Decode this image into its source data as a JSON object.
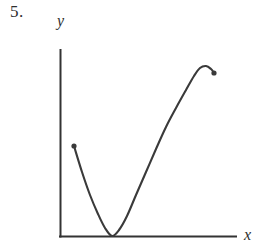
{
  "figure": {
    "problem_number": "5.",
    "y_axis_label": "y",
    "x_axis_label": "x",
    "stroke_color": "#3a3a3a",
    "axis_color": "#333333",
    "background_color": "#ffffff"
  },
  "chart_data": {
    "type": "line",
    "title": "",
    "subtitle": "",
    "xlabel": "x",
    "ylabel": "y",
    "grid": false,
    "legend": null,
    "annotations": [
      "5."
    ],
    "axes": {
      "y_axis_pixel_x": 60,
      "y_axis_pixel_top": 50,
      "x_axis_pixel_y": 236,
      "x_axis_pixel_right": 236,
      "origin_px": [
        60,
        236
      ],
      "tick_labels_x": [],
      "tick_labels_y": []
    },
    "endpoints": [
      {
        "name": "left-endpoint",
        "px": [
          74,
          146
        ],
        "closed": true
      },
      {
        "name": "right-endpoint",
        "px": [
          214,
          73
        ],
        "closed": true
      }
    ],
    "critical_points": [
      {
        "name": "local-minimum",
        "px": [
          112,
          236
        ],
        "type": "minimum",
        "touches_x_axis": true
      },
      {
        "name": "local-maximum",
        "px": [
          203,
          66
        ],
        "type": "maximum"
      }
    ],
    "inflection_points": [
      {
        "name": "inflection",
        "px": [
          152,
          158
        ]
      }
    ],
    "curve_points_px": [
      [
        74,
        146
      ],
      [
        82,
        172
      ],
      [
        90,
        195
      ],
      [
        98,
        214
      ],
      [
        105,
        228
      ],
      [
        112,
        236
      ],
      [
        119,
        230
      ],
      [
        127,
        216
      ],
      [
        136,
        195
      ],
      [
        146,
        172
      ],
      [
        156,
        149
      ],
      [
        166,
        127
      ],
      [
        176,
        108
      ],
      [
        186,
        90
      ],
      [
        194,
        76
      ],
      [
        200,
        68
      ],
      [
        206,
        66
      ],
      [
        211,
        69
      ],
      [
        214,
        73
      ]
    ]
  }
}
